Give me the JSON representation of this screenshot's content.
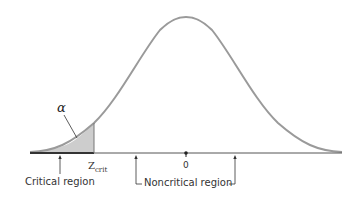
{
  "diagram": {
    "alpha_label": "α",
    "zcrit_main": "Z",
    "zcrit_sub": "crit",
    "zero_label": "0",
    "critical_region_label": "Critical region",
    "noncritical_region_label": "Noncritical region",
    "colors": {
      "curve": "#9a9a9a",
      "shade": "#cdcdcd",
      "axis": "#555555",
      "critical_axis": "#333333"
    }
  }
}
